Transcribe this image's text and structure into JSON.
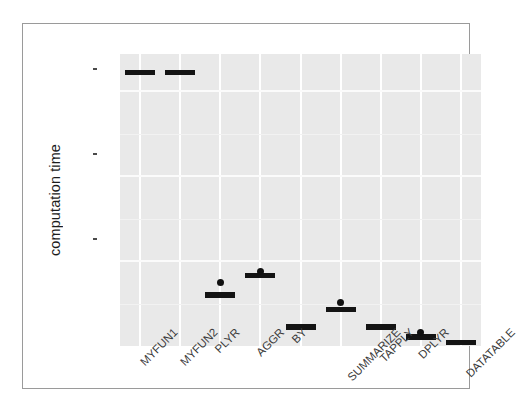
{
  "chart_data": {
    "type": "box",
    "title": "",
    "xlabel": "",
    "ylabel": "computation time",
    "ylim": [
      0,
      8600000000
    ],
    "grid": true,
    "legend": "none",
    "y_ticks": [
      {
        "label": "2.5e+09",
        "value": 2500000000
      },
      {
        "label": "5.0e+09",
        "value": 5000000000
      },
      {
        "label": "7.5e+09",
        "value": 7500000000
      }
    ],
    "categories": [
      "MYFUN1",
      "MYFUN2",
      "PLYR",
      "AGGR",
      "BY",
      "SUMMARIZE",
      "TAPPLY",
      "DPLYR",
      "DATATABLE"
    ],
    "boxes": [
      {
        "category": "MYFUN1",
        "min": 8050000000,
        "q1": 8050000000,
        "median": 8060000000,
        "q3": 8070000000,
        "max": 8070000000,
        "outliers": []
      },
      {
        "category": "MYFUN2",
        "min": 8040000000,
        "q1": 8045000000,
        "median": 8055000000,
        "q3": 8065000000,
        "max": 8070000000,
        "outliers": []
      },
      {
        "category": "PLYR",
        "min": 1480000000,
        "q1": 1490000000,
        "median": 1500000000,
        "q3": 1510000000,
        "max": 1520000000,
        "outliers": [
          1880000000
        ]
      },
      {
        "category": "AGGR",
        "min": 2050000000,
        "q1": 2060000000,
        "median": 2080000000,
        "q3": 2100000000,
        "max": 2110000000,
        "outliers": [
          2180000000
        ]
      },
      {
        "category": "BY",
        "min": 520000000,
        "q1": 535000000,
        "median": 560000000,
        "q3": 585000000,
        "max": 600000000,
        "outliers": []
      },
      {
        "category": "SUMMARIZE",
        "min": 1050000000,
        "q1": 1060000000,
        "median": 1080000000,
        "q3": 1095000000,
        "max": 1100000000,
        "outliers": [
          1290000000
        ]
      },
      {
        "category": "TAPPLY",
        "min": 510000000,
        "q1": 530000000,
        "median": 555000000,
        "q3": 580000000,
        "max": 595000000,
        "outliers": []
      },
      {
        "category": "DPLYR",
        "min": 240000000,
        "q1": 248000000,
        "median": 258000000,
        "q3": 268000000,
        "max": 275000000,
        "outliers": [
          390000000
        ]
      },
      {
        "category": "DATATABLE",
        "min": 60000000,
        "q1": 75000000,
        "median": 100000000,
        "q3": 125000000,
        "max": 140000000,
        "outliers": []
      }
    ],
    "colors": {
      "panel_background": "#e9e9e9",
      "gridline": "#ffffff",
      "box_stroke": "#1c1c1c",
      "box_fill": "#ffffff",
      "median": "#141414",
      "outlier": "#111111",
      "text": "#3a3a3a",
      "frame": "#9a9a9a"
    }
  }
}
